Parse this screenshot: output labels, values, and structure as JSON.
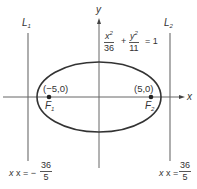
{
  "diagram": {
    "type": "ellipse-with-directrices",
    "equation": {
      "x_term_num": "x",
      "x_term_exp": "2",
      "x_term_den": "36",
      "plus": "+",
      "y_term_num": "y",
      "y_term_exp": "2",
      "y_term_den": "11",
      "equals": "= 1"
    },
    "axes": {
      "x_label": "x",
      "y_label": "y"
    },
    "directrices": [
      {
        "name": "L",
        "sub": "1",
        "eq_prefix": "x = −",
        "num": "36",
        "den": "5"
      },
      {
        "name": "L",
        "sub": "2",
        "eq_prefix": "x =",
        "num": "36",
        "den": "5"
      }
    ],
    "foci": [
      {
        "name": "F",
        "sub": "1",
        "coords": "(−5,0)"
      },
      {
        "name": "F",
        "sub": "2",
        "coords": "(5,0)"
      }
    ],
    "colors": {
      "ellipse": "#333333",
      "axes": "#666666",
      "directrix": "#777777",
      "text": "#333333"
    }
  }
}
